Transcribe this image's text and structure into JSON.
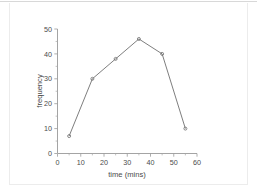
{
  "chart_data": {
    "type": "line",
    "title": "",
    "subtitle": "",
    "xlabel": "time (mins)",
    "ylabel": "frequency",
    "x": [
      5,
      15,
      25,
      35,
      45,
      55
    ],
    "values": [
      7,
      30,
      38,
      46,
      40,
      10
    ],
    "series": [
      {
        "name": "frequency",
        "x": [
          5,
          15,
          25,
          35,
          45,
          55
        ],
        "values": [
          7,
          30,
          38,
          46,
          40,
          10
        ],
        "color": "#6f6f6f",
        "marker": "open-circle"
      }
    ],
    "xlim": [
      0,
      60
    ],
    "ylim": [
      0,
      50
    ],
    "xticks": [
      0,
      10,
      20,
      30,
      40,
      50,
      60
    ],
    "yticks": [
      0,
      10,
      20,
      30,
      40,
      50
    ],
    "xtick_labels": [
      "0",
      "10",
      "20",
      "30",
      "40",
      "50",
      "60"
    ],
    "ytick_labels": [
      "0",
      "10",
      "20",
      "30",
      "40",
      "50"
    ],
    "x_minor_interval": 5,
    "y_minor_interval": 5,
    "grid": false,
    "legend": false,
    "legend_position": "none",
    "annotations": []
  },
  "axes": {
    "x_title": "time (mins)",
    "y_title": "frequency"
  },
  "style": {
    "axis_color": "#9a9a9a",
    "line_color": "#6f6f6f",
    "text_color": "#4a4a4a",
    "background": "#ffffff",
    "frame_color": "#ececec"
  }
}
